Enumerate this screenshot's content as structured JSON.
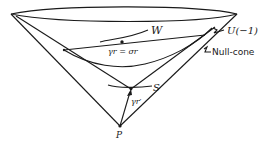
{
  "diagram": {
    "labels": {
      "W": "W",
      "gamma_eq_sigma": "γr = σr",
      "U": "U(−1)",
      "null_cone": "Null-cone",
      "S": "S",
      "gamma_prime": "γr′",
      "P": "P"
    },
    "colors": {
      "stroke": "#1a1a1a",
      "background": "#ffffff"
    }
  }
}
